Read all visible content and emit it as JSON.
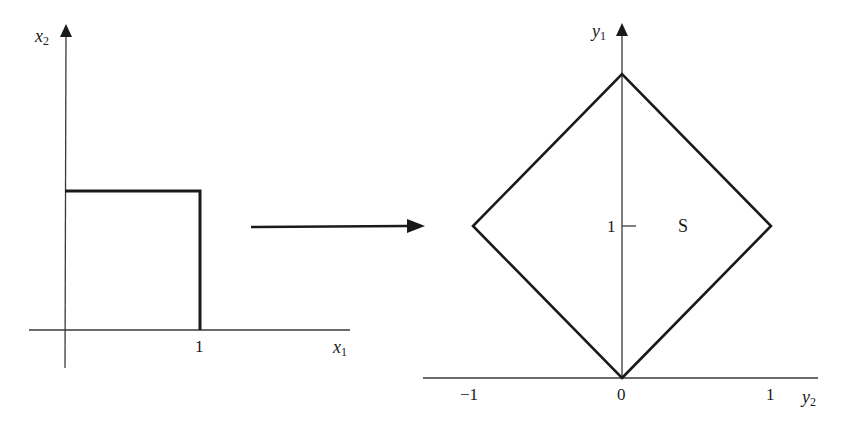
{
  "figure": {
    "left_panel": {
      "horizontal_axis": {
        "name": "x",
        "subscript": "1"
      },
      "vertical_axis": {
        "name": "x",
        "subscript": "2"
      },
      "tick_labels": [
        "1"
      ],
      "shape": "unit square (corners (0,0), (1,0), (1,1), (0,1))"
    },
    "mapping_arrow": "arrow",
    "right_panel": {
      "horizontal_axis": {
        "name": "y",
        "subscript": "2"
      },
      "vertical_axis": {
        "name": "y",
        "subscript": "1"
      },
      "x_tick_labels": [
        "−1",
        "0",
        "1"
      ],
      "y_tick_labels": [
        "1"
      ],
      "region_label": "S",
      "shape": "diamond (vertices (0,0), (1,1), (0,2), (−1,1))"
    },
    "colors": {
      "stroke": "#1a1a1a",
      "axis": "#3a3a3a",
      "background": "#ffffff"
    }
  }
}
